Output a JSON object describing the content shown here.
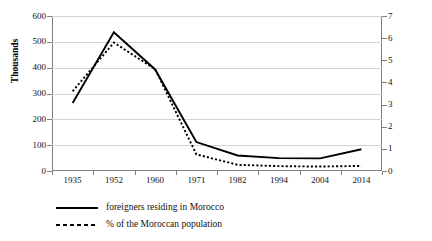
{
  "chart_data": {
    "type": "line",
    "title": "",
    "xlabel": "",
    "ylabel": "Thousands",
    "y2label": "",
    "categories": [
      "1935",
      "1952",
      "1960",
      "1971",
      "1982",
      "1994",
      "2004",
      "2014"
    ],
    "ylim": [
      0,
      600
    ],
    "y2lim": [
      0,
      7
    ],
    "yticks": [
      "600",
      "500",
      "400",
      "300",
      "200",
      "100",
      "0"
    ],
    "y2ticks": [
      "7",
      "6",
      "5",
      "4",
      "3",
      "2",
      "1",
      "0"
    ],
    "grid": true,
    "legend_position": "bottom-left",
    "series": [
      {
        "name": "foreigners residing in Morocco",
        "axis": "left",
        "style": "solid",
        "color": "#000000",
        "values": [
          263,
          537,
          393,
          112,
          60,
          50,
          49,
          84
        ]
      },
      {
        "name": "% of the Moroccan population",
        "axis": "right",
        "style": "dotted",
        "color": "#000000",
        "values": [
          3.6,
          5.8,
          4.6,
          0.75,
          0.28,
          0.22,
          0.2,
          0.23
        ]
      }
    ]
  },
  "legend": {
    "items": [
      {
        "label": "foreigners residing in Morocco",
        "style": "solid"
      },
      {
        "label": "% of the Moroccan population",
        "style": "dotted"
      }
    ]
  }
}
